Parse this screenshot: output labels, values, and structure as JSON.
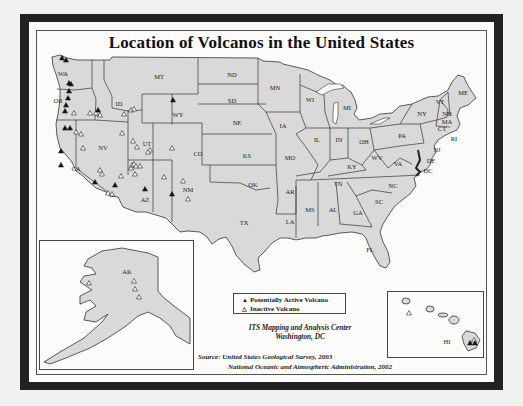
{
  "title": "Location of Volcanos in the United States",
  "legend": {
    "active_symbol": "▲",
    "active_label": "Potentially Active Volcano",
    "inactive_symbol": "△",
    "inactive_label": "Inactive Volcano"
  },
  "producer": {
    "line1": "ITS Mapping and Analysis Center",
    "line2": "Washington, DC"
  },
  "source": {
    "line1": "Source: United States Geological Survey, 2003",
    "line2": "National Oceanic and Atmospheric Administration, 2002"
  },
  "colors": {
    "land": "#d9d9d9",
    "border": "#333333",
    "frame": "#222222",
    "water": "#fbfbfa"
  },
  "states": [
    {
      "code": "WA",
      "x": 63,
      "y": 73
    },
    {
      "code": "OR",
      "x": 58,
      "y": 100
    },
    {
      "code": "ID",
      "x": 119,
      "y": 103
    },
    {
      "code": "MT",
      "x": 159,
      "y": 76
    },
    {
      "code": "WY",
      "x": 178,
      "y": 114
    },
    {
      "code": "ND",
      "x": 232,
      "y": 74
    },
    {
      "code": "SD",
      "x": 232,
      "y": 100
    },
    {
      "code": "MN",
      "x": 275,
      "y": 87
    },
    {
      "code": "WI",
      "x": 310,
      "y": 99
    },
    {
      "code": "MI",
      "x": 347,
      "y": 107
    },
    {
      "code": "NE",
      "x": 237,
      "y": 122
    },
    {
      "code": "IA",
      "x": 283,
      "y": 125
    },
    {
      "code": "IL",
      "x": 317,
      "y": 139
    },
    {
      "code": "IN",
      "x": 339,
      "y": 139
    },
    {
      "code": "OH",
      "x": 364,
      "y": 141
    },
    {
      "code": "PA",
      "x": 402,
      "y": 135
    },
    {
      "code": "NY",
      "x": 422,
      "y": 113
    },
    {
      "code": "VT",
      "x": 440,
      "y": 101
    },
    {
      "code": "NH",
      "x": 447,
      "y": 113
    },
    {
      "code": "MA",
      "x": 447,
      "y": 121
    },
    {
      "code": "CT",
      "x": 442,
      "y": 128
    },
    {
      "code": "RI",
      "x": 454,
      "y": 138
    },
    {
      "code": "ME",
      "x": 463,
      "y": 92
    },
    {
      "code": "NJ",
      "x": 437,
      "y": 149
    },
    {
      "code": "DE",
      "x": 431,
      "y": 160
    },
    {
      "code": "DC",
      "x": 428,
      "y": 170
    },
    {
      "code": "NV",
      "x": 103,
      "y": 147
    },
    {
      "code": "UT",
      "x": 147,
      "y": 143
    },
    {
      "code": "CO",
      "x": 198,
      "y": 153
    },
    {
      "code": "KS",
      "x": 247,
      "y": 155
    },
    {
      "code": "MO",
      "x": 290,
      "y": 157
    },
    {
      "code": "KY",
      "x": 352,
      "y": 166
    },
    {
      "code": "WV",
      "x": 377,
      "y": 157
    },
    {
      "code": "VA",
      "x": 398,
      "y": 163
    },
    {
      "code": "CA",
      "x": 76,
      "y": 168
    },
    {
      "code": "AZ",
      "x": 145,
      "y": 199
    },
    {
      "code": "NM",
      "x": 188,
      "y": 189
    },
    {
      "code": "OK",
      "x": 253,
      "y": 184
    },
    {
      "code": "AR",
      "x": 290,
      "y": 191
    },
    {
      "code": "TN",
      "x": 338,
      "y": 183
    },
    {
      "code": "NC",
      "x": 393,
      "y": 185
    },
    {
      "code": "SC",
      "x": 379,
      "y": 201
    },
    {
      "code": "MS",
      "x": 310,
      "y": 209
    },
    {
      "code": "AL",
      "x": 333,
      "y": 209
    },
    {
      "code": "GA",
      "x": 358,
      "y": 212
    },
    {
      "code": "LA",
      "x": 290,
      "y": 221
    },
    {
      "code": "TX",
      "x": 244,
      "y": 222
    },
    {
      "code": "FL",
      "x": 370,
      "y": 249
    },
    {
      "code": "AK",
      "x": 127,
      "y": 271
    },
    {
      "code": "HI",
      "x": 447,
      "y": 341
    }
  ],
  "volcanoes": {
    "active": [
      [
        62,
        58
      ],
      [
        66,
        60
      ],
      [
        69,
        83
      ],
      [
        71,
        84
      ],
      [
        69,
        91
      ],
      [
        68,
        98
      ],
      [
        66,
        105
      ],
      [
        65,
        111
      ],
      [
        65,
        128
      ],
      [
        70,
        128
      ],
      [
        61,
        151
      ],
      [
        98,
        110
      ],
      [
        173,
        100
      ],
      [
        145,
        189
      ],
      [
        172,
        194
      ],
      [
        115,
        185
      ],
      [
        61,
        165
      ],
      [
        95,
        182
      ],
      [
        470,
        343
      ],
      [
        475,
        343
      ]
    ],
    "inactive": [
      [
        74,
        113
      ],
      [
        90,
        113
      ],
      [
        98,
        113
      ],
      [
        100,
        115
      ],
      [
        96,
        113
      ],
      [
        124,
        114
      ],
      [
        131,
        110
      ],
      [
        134,
        109
      ],
      [
        76,
        132
      ],
      [
        81,
        134
      ],
      [
        83,
        148
      ],
      [
        122,
        133
      ],
      [
        133,
        141
      ],
      [
        137,
        147
      ],
      [
        150,
        150
      ],
      [
        131,
        168
      ],
      [
        132,
        165
      ],
      [
        134,
        164
      ],
      [
        136,
        166
      ],
      [
        140,
        166
      ],
      [
        148,
        152
      ],
      [
        135,
        174
      ],
      [
        108,
        193
      ],
      [
        112,
        194
      ],
      [
        172,
        148
      ],
      [
        183,
        181
      ],
      [
        188,
        199
      ],
      [
        100,
        170
      ],
      [
        102,
        174
      ],
      [
        121,
        176
      ],
      [
        164,
        177
      ],
      [
        134,
        281
      ],
      [
        135,
        289
      ],
      [
        139,
        297
      ],
      [
        89,
        283
      ],
      [
        409,
        313
      ],
      [
        474,
        340
      ]
    ]
  }
}
